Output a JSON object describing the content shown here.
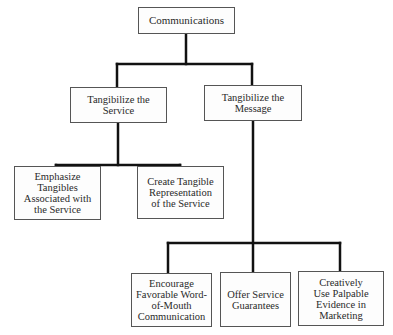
{
  "diagram": {
    "type": "hierarchy",
    "root": {
      "label": "Communications"
    },
    "level1": [
      {
        "label": "Tangibilize the Service"
      },
      {
        "label": "Tangibilize the Message"
      }
    ],
    "service_children": [
      {
        "label": "Emphasize Tangibles Associated with the Service"
      },
      {
        "label": "Create Tangible Representation of the Service"
      }
    ],
    "message_children": [
      {
        "label": "Encourage Favorable Word-of-Mouth Communication"
      },
      {
        "label": "Offer Service Guarantees"
      },
      {
        "label": "Creatively Use Palpable Evidence in Marketing"
      }
    ],
    "edges": [
      [
        "Communications",
        "Tangibilize the Service"
      ],
      [
        "Communications",
        "Tangibilize the Message"
      ],
      [
        "Tangibilize the Service",
        "Emphasize Tangibles Associated with the Service"
      ],
      [
        "Tangibilize the Service",
        "Create Tangible Representation of the Service"
      ],
      [
        "Tangibilize the Message",
        "Encourage Favorable Word-of-Mouth Communication"
      ],
      [
        "Tangibilize the Message",
        "Offer Service Guarantees"
      ],
      [
        "Tangibilize the Message",
        "Creatively Use Palpable Evidence in Marketing"
      ]
    ],
    "colors": {
      "connector": "#111111",
      "box_border": "#555555",
      "text": "#2a2a2a"
    }
  }
}
